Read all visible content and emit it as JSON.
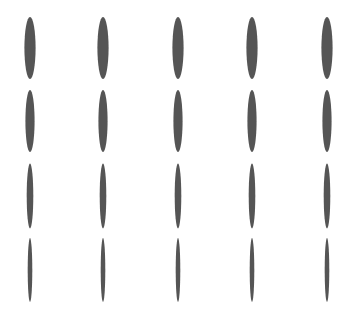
{
  "canvas": {
    "width": 353,
    "height": 310,
    "background_color": "#ffffff",
    "title": "Vertical ellipse grid"
  },
  "stimulus": {
    "shape_kind": "ellipse",
    "orientation_deg": 0,
    "fill_color": "#555555",
    "edge_softness_px": 0.6,
    "rows": 4,
    "columns": 5,
    "column_centers_x": [
      30,
      103,
      178,
      252,
      327
    ],
    "row_centers_y": [
      48,
      121,
      196,
      270
    ],
    "row_radius_x": [
      5.6,
      4.6,
      3.3,
      2.3
    ],
    "row_radius_y": [
      31,
      31,
      32.5,
      32
    ],
    "row_labels": [
      "row-1-widest",
      "row-2-wide",
      "row-3-narrow",
      "row-4-narrowest"
    ],
    "column_labels": [
      "col-1",
      "col-2",
      "col-3",
      "col-4",
      "col-5"
    ]
  },
  "chart_data": {
    "type": "scatter",
    "xlabel": "",
    "ylabel": "",
    "xlim": [
      0,
      353
    ],
    "ylim": [
      310,
      0
    ],
    "grid": false,
    "legend": "none",
    "marker": "vertical-ellipse",
    "marker_color": "#555555",
    "categories": [
      "col-1",
      "col-2",
      "col-3",
      "col-4",
      "col-5"
    ],
    "series": [
      {
        "name": "row-1-widest",
        "y": 48,
        "x": [
          30,
          103,
          178,
          252,
          327
        ],
        "ellipse_rx": 5.6,
        "ellipse_ry": 31,
        "values": [
          11.2,
          11.2,
          11.2,
          11.2,
          11.2
        ]
      },
      {
        "name": "row-2-wide",
        "y": 121,
        "x": [
          30,
          103,
          178,
          252,
          327
        ],
        "ellipse_rx": 4.6,
        "ellipse_ry": 31,
        "values": [
          9.2,
          9.2,
          9.2,
          9.2,
          9.2
        ]
      },
      {
        "name": "row-3-narrow",
        "y": 196,
        "x": [
          30,
          103,
          178,
          252,
          327
        ],
        "ellipse_rx": 3.3,
        "ellipse_ry": 32.5,
        "values": [
          6.6,
          6.6,
          6.6,
          6.6,
          6.6
        ]
      },
      {
        "name": "row-4-narrowest",
        "y": 270,
        "x": [
          30,
          103,
          178,
          252,
          327
        ],
        "ellipse_rx": 2.3,
        "ellipse_ry": 32,
        "values": [
          4.6,
          4.6,
          4.6,
          4.6,
          4.6
        ]
      }
    ]
  }
}
